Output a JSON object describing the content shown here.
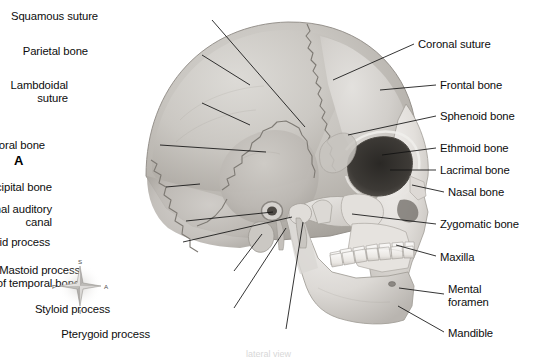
{
  "figure": {
    "panel_letter": "A",
    "background_color": "#ffffff",
    "ink_color": "#0d0d0d",
    "caption_partial": "lateral view"
  },
  "compass": {
    "name": "anatomical-orientation-compass",
    "superior": "S",
    "inferior": "I",
    "posterior": "P",
    "anterior": "A"
  },
  "labels_left": [
    {
      "id": "squamous-suture",
      "text": "Squamous suture",
      "lines": [
        "Squamous suture"
      ],
      "x": 98,
      "y": 10,
      "align": "r",
      "w": 110,
      "leader": [
        [
          212,
          20
        ],
        [
          305,
          127
        ]
      ]
    },
    {
      "id": "parietal-bone",
      "text": "Parietal bone",
      "lines": [
        "Parietal bone"
      ],
      "x": 88,
      "y": 45,
      "align": "r",
      "w": 110,
      "leader": [
        [
          202,
          55
        ],
        [
          250,
          85
        ]
      ]
    },
    {
      "id": "lambdoidal-suture",
      "text": "Lambdoidal suture",
      "lines": [
        "Lambdoidal",
        "suture"
      ],
      "x": 68,
      "y": 79,
      "align": "r",
      "w": 130,
      "leader": [
        [
          202,
          103
        ],
        [
          250,
          125
        ]
      ]
    },
    {
      "id": "temporal-bone",
      "text": "Temporal bone",
      "lines": [
        "Temporal bone"
      ],
      "x": 45,
      "y": 139,
      "align": "r",
      "w": 110,
      "leader": [
        [
          160,
          145
        ],
        [
          266,
          152
        ]
      ]
    },
    {
      "id": "occipital-bone",
      "text": "Occipital bone",
      "lines": [
        "Occipital bone"
      ],
      "x": 52,
      "y": 181,
      "align": "r",
      "w": 110,
      "leader": [
        [
          166,
          187
        ],
        [
          200,
          184
        ]
      ]
    },
    {
      "id": "external-auditory-canal",
      "text": "External auditory canal",
      "lines": [
        "External auditory",
        "canal"
      ],
      "x": 52,
      "y": 203,
      "align": "r",
      "w": 130,
      "leader": [
        [
          186,
          221
        ],
        [
          273,
          212
        ]
      ]
    },
    {
      "id": "condyloid-process",
      "text": "Condyloid process",
      "lines": [
        "Condyloid process"
      ],
      "x": 50,
      "y": 236,
      "align": "r",
      "w": 130,
      "leader": [
        [
          183,
          242
        ],
        [
          292,
          217
        ]
      ]
    },
    {
      "id": "mastoid-process",
      "text": "Mastoid process of temporal bone",
      "lines": [
        "Mastoid process",
        "of temporal bone"
      ],
      "x": 80,
      "y": 264,
      "align": "r",
      "w": 150,
      "leader": [
        [
          234,
          271
        ],
        [
          262,
          234
        ]
      ]
    },
    {
      "id": "styloid-process",
      "text": "Styloid process",
      "lines": [
        "Styloid process"
      ],
      "x": 110,
      "y": 303,
      "align": "r",
      "w": 120,
      "leader": [
        [
          234,
          308
        ],
        [
          286,
          228
        ]
      ]
    },
    {
      "id": "pterygoid-process",
      "text": "Pterygoid process",
      "lines": [
        "Pterygoid process"
      ],
      "x": 150,
      "y": 328,
      "align": "r",
      "w": 130,
      "leader": [
        [
          286,
          329
        ],
        [
          303,
          222
        ]
      ]
    }
  ],
  "labels_right": [
    {
      "id": "coronal-suture",
      "text": "Coronal suture",
      "lines": [
        "Coronal suture"
      ],
      "x": 418,
      "y": 38,
      "align": "l",
      "leader": [
        [
          414,
          44
        ],
        [
          333,
          80
        ]
      ]
    },
    {
      "id": "frontal-bone",
      "text": "Frontal bone",
      "lines": [
        "Frontal bone"
      ],
      "x": 440,
      "y": 79,
      "align": "l",
      "leader": [
        [
          436,
          85
        ],
        [
          380,
          90
        ]
      ]
    },
    {
      "id": "sphenoid-bone",
      "text": "Sphenoid bone",
      "lines": [
        "Sphenoid bone"
      ],
      "x": 440,
      "y": 110,
      "align": "l",
      "leader": [
        [
          436,
          116
        ],
        [
          348,
          135
        ]
      ]
    },
    {
      "id": "ethmoid-bone",
      "text": "Ethmoid bone",
      "lines": [
        "Ethmoid bone"
      ],
      "x": 440,
      "y": 142,
      "align": "l",
      "leader": [
        [
          436,
          148
        ],
        [
          382,
          155
        ]
      ]
    },
    {
      "id": "lacrimal-bone",
      "text": "Lacrimal bone",
      "lines": [
        "Lacrimal bone"
      ],
      "x": 440,
      "y": 164,
      "align": "l",
      "leader": [
        [
          436,
          170
        ],
        [
          390,
          170
        ]
      ]
    },
    {
      "id": "nasal-bone",
      "text": "Nasal bone",
      "lines": [
        "Nasal bone"
      ],
      "x": 448,
      "y": 186,
      "align": "l",
      "leader": [
        [
          444,
          192
        ],
        [
          412,
          185
        ]
      ]
    },
    {
      "id": "zygomatic-bone",
      "text": "Zygomatic bone",
      "lines": [
        "Zygomatic bone"
      ],
      "x": 440,
      "y": 218,
      "align": "l",
      "leader": [
        [
          436,
          224
        ],
        [
          352,
          214
        ]
      ]
    },
    {
      "id": "maxilla",
      "text": "Maxilla",
      "lines": [
        "Maxilla"
      ],
      "x": 440,
      "y": 251,
      "align": "l",
      "leader": [
        [
          436,
          256
        ],
        [
          396,
          245
        ]
      ]
    },
    {
      "id": "mental-foramen",
      "text": "Mental foramen",
      "lines": [
        "Mental",
        "foramen"
      ],
      "x": 448,
      "y": 283,
      "align": "l",
      "leader": [
        [
          444,
          294
        ],
        [
          399,
          288
        ]
      ]
    },
    {
      "id": "mandible",
      "text": "Mandible",
      "lines": [
        "Mandible"
      ],
      "x": 448,
      "y": 327,
      "align": "l",
      "leader": [
        [
          444,
          332
        ],
        [
          398,
          306
        ]
      ]
    }
  ]
}
